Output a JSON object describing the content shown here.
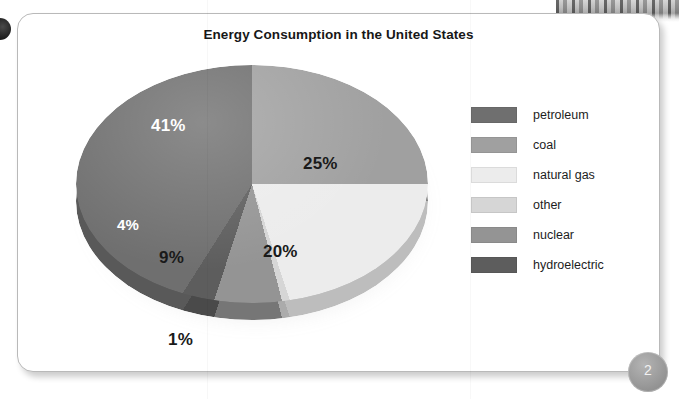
{
  "slide": {
    "title": "Energy Consumption in the United States",
    "page_number": "2"
  },
  "chart_data": {
    "type": "pie",
    "title": "Energy Consumption in the United States",
    "xlabel": "",
    "ylabel": "",
    "legend_position": "right",
    "units": "percent",
    "categories": [
      "petroleum",
      "coal",
      "natural gas",
      "other",
      "nuclear",
      "hydroelectric"
    ],
    "values": [
      41,
      25,
      20,
      1,
      9,
      4
    ],
    "labels": [
      "41%",
      "25%",
      "20%",
      "1%",
      "9%",
      "4%"
    ],
    "colors": [
      "#6f6f6f",
      "#a0a0a0",
      "#ececec",
      "#d6d6d6",
      "#949494",
      "#5d5d5d"
    ],
    "label_colors": [
      "#ffffff",
      "#1a1a1a",
      "#1a1a1a",
      "#1a1a1a",
      "#1a1a1a",
      "#ffffff"
    ],
    "slices": [
      {
        "name": "petroleum",
        "value": 41,
        "label": "41%",
        "color": "#6f6f6f",
        "label_color": "white"
      },
      {
        "name": "coal",
        "value": 25,
        "label": "25%",
        "color": "#a0a0a0",
        "label_color": "dark"
      },
      {
        "name": "natural gas",
        "value": 20,
        "label": "20%",
        "color": "#ececec",
        "label_color": "dark"
      },
      {
        "name": "other",
        "value": 1,
        "label": "1%",
        "color": "#d6d6d6",
        "label_color": "dark"
      },
      {
        "name": "nuclear",
        "value": 9,
        "label": "9%",
        "color": "#949494",
        "label_color": "dark"
      },
      {
        "name": "hydroelectric",
        "value": 4,
        "label": "4%",
        "color": "#5d5d5d",
        "label_color": "white"
      }
    ]
  },
  "legend": {
    "items": [
      {
        "label": "petroleum",
        "color": "#6f6f6f"
      },
      {
        "label": "coal",
        "color": "#a0a0a0"
      },
      {
        "label": "natural gas",
        "color": "#ececec"
      },
      {
        "label": "other",
        "color": "#d6d6d6"
      },
      {
        "label": "nuclear",
        "color": "#949494"
      },
      {
        "label": "hydroelectric",
        "color": "#5d5d5d"
      }
    ]
  },
  "pie_labels": {
    "petroleum": "41%",
    "coal": "25%",
    "natural_gas": "20%",
    "nuclear": "9%",
    "hydroelectric": "4%",
    "other": "1%"
  }
}
